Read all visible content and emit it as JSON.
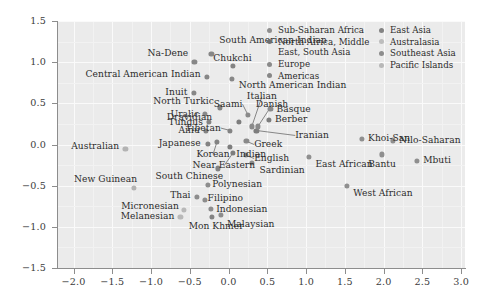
{
  "chart_data": {
    "type": "scatter",
    "title": "",
    "xlabel": "",
    "ylabel": "",
    "xlim": [
      -2.2,
      3.05
    ],
    "ylim": [
      -1.5,
      1.5
    ],
    "grid": true,
    "legend_position": "top-right-inside",
    "xticks": [
      "-2.0",
      "-1.5",
      "-1.0",
      "-0.5",
      "0.0",
      "0.5",
      "1.0",
      "1.5",
      "2.0",
      "2.5",
      "3.0"
    ],
    "xtick_values": [
      -2.0,
      -1.5,
      -1.0,
      -0.5,
      0.0,
      0.5,
      1.0,
      1.5,
      2.0,
      2.5,
      3.0
    ],
    "yticks": [
      "1.5",
      "1.0",
      "0.5",
      "0.0",
      "-0.5",
      "-1.0",
      "-1.5"
    ],
    "ytick_values": [
      1.5,
      1.0,
      0.5,
      0.0,
      -0.5,
      -1.0,
      -1.5
    ],
    "series": [
      {
        "name": "Sub-Saharan Africa",
        "color": "#8f8f8f",
        "points": [
          {
            "label": "Khoi-San",
            "x": 1.72,
            "y": 0.07,
            "lx": 1.8,
            "ly": 0.07,
            "anchor": "left"
          },
          {
            "label": "Nilo-Saharan",
            "x": 2.12,
            "y": 0.05,
            "lx": 2.2,
            "ly": 0.05,
            "anchor": "left"
          },
          {
            "label": "Bantu",
            "x": 1.98,
            "y": -0.12,
            "lx": 1.98,
            "ly": -0.24,
            "anchor": "center"
          },
          {
            "label": "Mbuti",
            "x": 2.43,
            "y": -0.2,
            "lx": 2.51,
            "ly": -0.2,
            "anchor": "left"
          },
          {
            "label": "East African",
            "x": 1.04,
            "y": -0.15,
            "lx": 1.12,
            "ly": -0.24,
            "anchor": "left"
          },
          {
            "label": "West African",
            "x": 1.53,
            "y": -0.5,
            "lx": 1.61,
            "ly": -0.59,
            "anchor": "left"
          }
        ]
      },
      {
        "name": "North Africa, Middle East, South Asia",
        "color": "#7d7d7d",
        "points": [
          {
            "label": "Berber",
            "x": 0.52,
            "y": 0.3,
            "lx": 0.6,
            "ly": 0.3,
            "anchor": "left"
          },
          {
            "label": "Iranian",
            "x": 0.36,
            "y": 0.17,
            "lx": 0.86,
            "ly": 0.11,
            "anchor": "left",
            "leader": true
          },
          {
            "label": "Indian",
            "x": 0.02,
            "y": -0.03,
            "lx": 0.1,
            "ly": -0.12,
            "anchor": "left"
          },
          {
            "label": "Dravidian",
            "x": 0.13,
            "y": 0.27,
            "lx": -0.21,
            "ly": 0.33,
            "anchor": "right"
          },
          {
            "label": "Near Eastern",
            "x": 0.06,
            "y": -0.1,
            "lx": -0.06,
            "ly": -0.26,
            "anchor": "center",
            "leader": true
          }
        ]
      },
      {
        "name": "Europe",
        "color": "#8a8a8a",
        "points": [
          {
            "label": "Saami",
            "x": 0.25,
            "y": 0.36,
            "lx": 0.18,
            "ly": 0.49,
            "anchor": "right",
            "leader": true
          },
          {
            "label": "Italian",
            "x": 0.3,
            "y": 0.22,
            "lx": 0.43,
            "ly": 0.58,
            "anchor": "center",
            "leader": true
          },
          {
            "label": "Danish",
            "x": 0.38,
            "y": 0.22,
            "lx": 0.56,
            "ly": 0.48,
            "anchor": "center",
            "leader": true
          },
          {
            "label": "Basque",
            "x": 0.54,
            "y": 0.43,
            "lx": 0.62,
            "ly": 0.43,
            "anchor": "left"
          },
          {
            "label": "Greek",
            "x": 0.23,
            "y": 0.04,
            "lx": 0.33,
            "ly": 0.0,
            "anchor": "left",
            "leader": true
          },
          {
            "label": "English",
            "x": 0.22,
            "y": -0.13,
            "lx": 0.33,
            "ly": -0.17,
            "anchor": "left",
            "leader": true
          },
          {
            "label": "Sardinian",
            "x": 0.3,
            "y": -0.22,
            "lx": 0.4,
            "ly": -0.31,
            "anchor": "left"
          },
          {
            "label": "Uralic",
            "x": -0.3,
            "y": 0.37,
            "lx": -0.38,
            "ly": 0.37,
            "anchor": "right"
          }
        ]
      },
      {
        "name": "Americas",
        "color": "#878787",
        "points": [
          {
            "label": "Na-Dene",
            "x": -0.44,
            "y": 1.0,
            "lx": -0.52,
            "ly": 1.11,
            "anchor": "right"
          },
          {
            "label": "South American Indian",
            "x": -0.22,
            "y": 1.1,
            "lx": -0.12,
            "ly": 1.26,
            "anchor": "left"
          },
          {
            "label": "Central American Indian",
            "x": -0.28,
            "y": 0.82,
            "lx": -0.36,
            "ly": 0.85,
            "anchor": "right"
          },
          {
            "label": "North American Indian",
            "x": 0.04,
            "y": 0.8,
            "lx": 0.13,
            "ly": 0.72,
            "anchor": "left"
          },
          {
            "label": "Inuit",
            "x": -0.45,
            "y": 0.63,
            "lx": -0.53,
            "ly": 0.63,
            "anchor": "right"
          }
        ]
      },
      {
        "name": "East Asia",
        "color": "#838383",
        "points": [
          {
            "label": "Chukchi",
            "x": 0.06,
            "y": 0.95,
            "lx": 0.05,
            "ly": 1.04,
            "anchor": "center"
          },
          {
            "label": "North Turkic",
            "x": -0.11,
            "y": 0.45,
            "lx": -0.19,
            "ly": 0.52,
            "anchor": "right"
          },
          {
            "label": "Tungus",
            "x": -0.25,
            "y": 0.27,
            "lx": -0.33,
            "ly": 0.27,
            "anchor": "right"
          },
          {
            "label": "Ainu",
            "x": -0.29,
            "y": 0.17,
            "lx": -0.37,
            "ly": 0.17,
            "anchor": "right"
          },
          {
            "label": "Tibetan",
            "x": 0.02,
            "y": 0.17,
            "lx": -0.1,
            "ly": 0.2,
            "anchor": "right",
            "leader": true
          },
          {
            "label": "Japanese",
            "x": -0.27,
            "y": 0.01,
            "lx": -0.36,
            "ly": 0.01,
            "anchor": "right"
          },
          {
            "label": "Korean",
            "x": -0.15,
            "y": 0.03,
            "lx": -0.2,
            "ly": -0.12,
            "anchor": "center",
            "leader": true
          },
          {
            "label": "South Chinese",
            "x": -0.14,
            "y": -0.29,
            "lx": -0.07,
            "ly": -0.39,
            "anchor": "right"
          },
          {
            "label": "Mon Khmer",
            "x": -0.21,
            "y": -0.88,
            "lx": -0.16,
            "ly": -0.99,
            "anchor": "center"
          }
        ]
      },
      {
        "name": "Australasia",
        "color": "#b3b3b3",
        "points": [
          {
            "label": "Australian",
            "x": -1.33,
            "y": -0.05,
            "lx": -1.41,
            "ly": -0.03,
            "anchor": "right"
          },
          {
            "label": "New Guinean",
            "x": -1.22,
            "y": -0.53,
            "lx": -1.18,
            "ly": -0.42,
            "anchor": "right"
          }
        ]
      },
      {
        "name": "Southeast Asia",
        "color": "#8d8d8d",
        "points": [
          {
            "label": "Thai",
            "x": -0.41,
            "y": -0.64,
            "lx": -0.49,
            "ly": -0.62,
            "anchor": "right"
          },
          {
            "label": "Filipino",
            "x": -0.31,
            "y": -0.67,
            "lx": -0.27,
            "ly": -0.66,
            "anchor": "left"
          },
          {
            "label": "Indonesian",
            "x": -0.23,
            "y": -0.78,
            "lx": -0.16,
            "ly": -0.79,
            "anchor": "left"
          },
          {
            "label": "Malaysian",
            "x": -0.1,
            "y": -0.86,
            "lx": -0.02,
            "ly": -0.97,
            "anchor": "left"
          },
          {
            "label": "Polynesian",
            "x": -0.27,
            "y": -0.49,
            "lx": -0.21,
            "ly": -0.49,
            "anchor": "left"
          }
        ]
      },
      {
        "name": "Pacific Islands",
        "color": "#b8b8b8",
        "points": [
          {
            "label": "Micronesian",
            "x": -0.58,
            "y": -0.79,
            "lx": -0.64,
            "ly": -0.75,
            "anchor": "right"
          },
          {
            "label": "Melanesian",
            "x": -0.62,
            "y": -0.88,
            "lx": -0.7,
            "ly": -0.88,
            "anchor": "right"
          }
        ]
      }
    ],
    "legend_entries": [
      {
        "label": "Sub-Saharan Africa",
        "color": "#8f8f8f",
        "col": 1
      },
      {
        "label": "North Africa, Middle East, South Asia",
        "color": "#6f6f6f",
        "col": 1
      },
      {
        "label": "Europe",
        "color": "#8a8a8a",
        "col": 1
      },
      {
        "label": "Americas",
        "color": "#878787",
        "col": 1
      },
      {
        "label": "East Asia",
        "color": "#838383",
        "col": 2
      },
      {
        "label": "Australasia",
        "color": "#bdbdbd",
        "col": 2
      },
      {
        "label": "Southeast Asia",
        "color": "#8d8d8d",
        "col": 2
      },
      {
        "label": "Pacific Islands",
        "color": "#b8b8b8",
        "col": 2
      }
    ]
  }
}
